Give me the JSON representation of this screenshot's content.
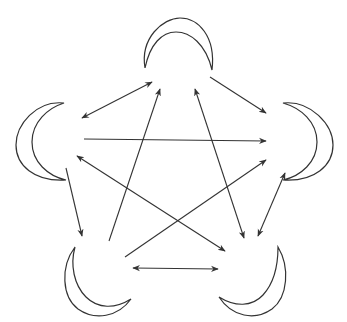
{
  "diagram": {
    "title": "",
    "stroke_color": "#333333",
    "background": "#ffffff",
    "nodes": [
      {
        "id": "top",
        "shape": "crescent",
        "icon": "crescent-moon-icon",
        "orientation": "horns-down",
        "cx": 178,
        "cy": 48
      },
      {
        "id": "left",
        "shape": "crescent",
        "icon": "crescent-moon-icon",
        "orientation": "horns-right",
        "cx": 44,
        "cy": 140
      },
      {
        "id": "right",
        "shape": "crescent",
        "icon": "crescent-moon-icon",
        "orientation": "horns-left",
        "cx": 305,
        "cy": 140
      },
      {
        "id": "bottom-left",
        "shape": "crescent",
        "icon": "crescent-moon-icon",
        "orientation": "horns-up-right",
        "cx": 100,
        "cy": 287
      },
      {
        "id": "bottom-right",
        "shape": "crescent",
        "icon": "crescent-moon-icon",
        "orientation": "horns-up-left",
        "cx": 250,
        "cy": 287
      }
    ],
    "edges": [
      {
        "from": "left",
        "to": "top",
        "direction": "both",
        "x1": 82,
        "y1": 118,
        "x2": 152,
        "y2": 82
      },
      {
        "from": "top",
        "to": "right",
        "direction": "forward",
        "x1": 210,
        "y1": 77,
        "x2": 266,
        "y2": 113
      },
      {
        "from": "left",
        "to": "right",
        "direction": "forward",
        "x1": 84,
        "y1": 139,
        "x2": 266,
        "y2": 141
      },
      {
        "from": "left",
        "to": "bottom-left",
        "direction": "forward",
        "x1": 66,
        "y1": 168,
        "x2": 82,
        "y2": 236
      },
      {
        "from": "bottom-left",
        "to": "top",
        "direction": "forward",
        "x1": 109,
        "y1": 241,
        "x2": 160,
        "y2": 89
      },
      {
        "from": "top",
        "to": "bottom-right",
        "direction": "both",
        "x1": 195,
        "y1": 89,
        "x2": 244,
        "y2": 238
      },
      {
        "from": "right",
        "to": "bottom-right",
        "direction": "both",
        "x1": 285,
        "y1": 173,
        "x2": 258,
        "y2": 236
      },
      {
        "from": "bottom-left",
        "to": "right",
        "direction": "forward",
        "x1": 125,
        "y1": 257,
        "x2": 266,
        "y2": 160
      },
      {
        "from": "left",
        "to": "bottom-right",
        "direction": "both",
        "x1": 77,
        "y1": 156,
        "x2": 225,
        "y2": 251
      },
      {
        "from": "bottom-left",
        "to": "bottom-right",
        "direction": "both",
        "x1": 133,
        "y1": 268,
        "x2": 218,
        "y2": 269
      }
    ]
  }
}
